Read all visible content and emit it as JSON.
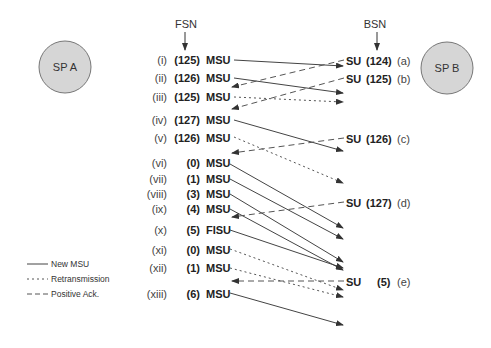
{
  "header": {
    "fsn_label": "FSN",
    "bsn_label": "BSN"
  },
  "nodes": {
    "sp_a": {
      "label": "SP A",
      "fill": "#d6d6d6",
      "stroke": "#777777"
    },
    "sp_b": {
      "label": "SP B",
      "fill": "#d6d6d6",
      "stroke": "#777777"
    }
  },
  "left_rows": [
    {
      "roman": "(i)",
      "seq": "(125)",
      "type": "MSU"
    },
    {
      "roman": "(ii)",
      "seq": "(126)",
      "type": "MSU"
    },
    {
      "roman": "(iii)",
      "seq": "(125)",
      "type": "MSU"
    },
    {
      "roman": "(iv)",
      "seq": "(127)",
      "type": "MSU"
    },
    {
      "roman": "(v)",
      "seq": "(126)",
      "type": "MSU"
    },
    {
      "roman": "(vi)",
      "seq": "(0)",
      "type": "MSU"
    },
    {
      "roman": "(vii)",
      "seq": "(1)",
      "type": "MSU"
    },
    {
      "roman": "(viii)",
      "seq": "(3)",
      "type": "MSU"
    },
    {
      "roman": "(ix)",
      "seq": "(4)",
      "type": "MSU"
    },
    {
      "roman": "(x)",
      "seq": "(5)",
      "type": "FISU"
    },
    {
      "roman": "(xi)",
      "seq": "(0)",
      "type": "MSU"
    },
    {
      "roman": "(xii)",
      "seq": "(1)",
      "type": "MSU"
    },
    {
      "roman": "(xiii)",
      "seq": "(6)",
      "type": "MSU"
    }
  ],
  "right_rows": [
    {
      "type": "SU",
      "seq": "(124)",
      "letter": "(a)"
    },
    {
      "type": "SU",
      "seq": "(125)",
      "letter": "(b)"
    },
    {
      "type": "SU",
      "seq": "(126)",
      "letter": "(c)"
    },
    {
      "type": "SU",
      "seq": "(127)",
      "letter": "(d)"
    },
    {
      "type": "SU",
      "seq": "(5)",
      "letter": "(e)"
    }
  ],
  "legend": {
    "items": [
      {
        "style": "solid",
        "label": "New MSU"
      },
      {
        "style": "dotted",
        "label": "Retransmission"
      },
      {
        "style": "dashed",
        "label": "Positive Ack."
      }
    ]
  },
  "colors": {
    "line": "#444444",
    "text": "#222222"
  }
}
